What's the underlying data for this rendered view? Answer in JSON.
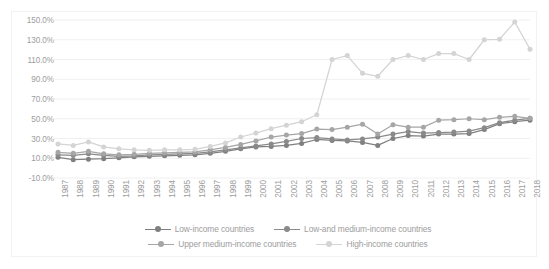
{
  "chart_data": {
    "type": "line",
    "title": "",
    "subtitle": "",
    "xlabel": "",
    "ylabel": "",
    "grid": "horizontal",
    "legend_position": "bottom",
    "ylim": [
      -10,
      150
    ],
    "ytick_step": 20,
    "ytick_labels": [
      "150.0%",
      "130.0%",
      "110.0%",
      "90.0%",
      "70.0%",
      "50.0%",
      "30.0%",
      "10.0%",
      "-10.0%"
    ],
    "ytick_values": [
      150,
      130,
      110,
      90,
      70,
      50,
      30,
      10,
      -10
    ],
    "categories": [
      "1987",
      "1988",
      "1989",
      "1990",
      "1991",
      "1992",
      "1993",
      "1994",
      "1995",
      "1996",
      "1997",
      "1998",
      "1999",
      "2000",
      "2001",
      "2002",
      "2003",
      "2004",
      "2005",
      "2006",
      "2007",
      "2008",
      "2009",
      "2010",
      "2011",
      "2012",
      "2013",
      "2014",
      "2015",
      "2016",
      "2017",
      "2018"
    ],
    "series": [
      {
        "name": "Low-income countries",
        "color": "#808080",
        "values": [
          11.0,
          8.5,
          9.0,
          9.5,
          10.5,
          11.5,
          12.0,
          12.5,
          13.0,
          13.5,
          15.0,
          17.0,
          19.5,
          21.5,
          22.0,
          23.0,
          25.0,
          29.0,
          28.0,
          27.5,
          26.0,
          23.0,
          30.0,
          33.0,
          32.5,
          34.5,
          34.5,
          35.0,
          39.0,
          45.0,
          47.0,
          48.5
        ]
      },
      {
        "name": "Low-and medium-income countries",
        "color": "#8a8a8a",
        "values": [
          13.5,
          13.0,
          14.5,
          13.0,
          12.0,
          12.5,
          13.5,
          14.0,
          14.5,
          15.0,
          16.5,
          18.5,
          20.5,
          22.5,
          24.5,
          27.0,
          30.0,
          31.0,
          29.5,
          28.5,
          29.5,
          31.5,
          34.5,
          37.0,
          35.5,
          36.0,
          36.5,
          37.5,
          41.0,
          46.0,
          48.5,
          50.5
        ]
      },
      {
        "name": "Upper medium-income countries",
        "color": "#a6a6a6",
        "values": [
          16.0,
          15.0,
          17.0,
          14.5,
          13.5,
          14.0,
          15.0,
          15.5,
          16.0,
          16.5,
          18.5,
          21.0,
          24.0,
          27.5,
          31.5,
          33.5,
          35.0,
          39.5,
          39.0,
          41.5,
          44.5,
          34.5,
          44.0,
          41.5,
          41.5,
          48.5,
          49.0,
          50.0,
          49.0,
          51.5,
          52.5,
          50.5
        ]
      },
      {
        "name": "High-income countries",
        "color": "#d4d4d4",
        "values": [
          24.5,
          23.0,
          26.5,
          21.5,
          19.5,
          18.5,
          18.0,
          18.5,
          18.5,
          19.0,
          22.0,
          25.5,
          31.5,
          35.5,
          40.0,
          43.5,
          47.0,
          54.0,
          110.0,
          114.0,
          96.0,
          93.0,
          110.0,
          114.0,
          110.0,
          116.0,
          116.0,
          110.0,
          130.0,
          130.5,
          148.0,
          120.5
        ]
      }
    ]
  },
  "legend": {
    "items": [
      {
        "label": "Low-income countries",
        "color": "#808080"
      },
      {
        "label": "Low-and medium-income countries",
        "color": "#8a8a8a"
      },
      {
        "label": "Upper medium-income countries",
        "color": "#a6a6a6"
      },
      {
        "label": "High-income countries",
        "color": "#d4d4d4"
      }
    ]
  },
  "style": {
    "background": "#ffffff",
    "gridline_color": "#f0f0f0",
    "axis_text_color": "#9d9d9d",
    "border_color": "#f2f2f2"
  }
}
